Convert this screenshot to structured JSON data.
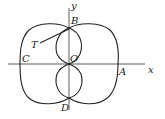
{
  "figure": {
    "axes": {
      "x_label": "x",
      "y_label": "y"
    },
    "points": {
      "origin": "O",
      "top": "B",
      "left": "C",
      "right": "A",
      "bottom": "D",
      "tangent": "T"
    },
    "colors": {
      "line": "#222222",
      "background": "#ffffff"
    }
  }
}
